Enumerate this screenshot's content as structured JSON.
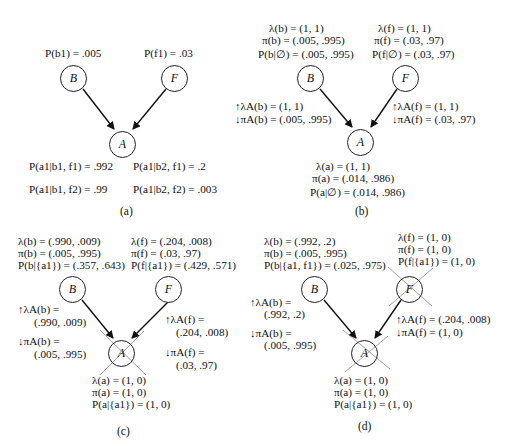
{
  "panels": {
    "a": {
      "caption": "(a)",
      "nodes": {
        "B": "B",
        "F": "F",
        "A": "A"
      },
      "priors": {
        "b": "P(b1) = .005",
        "f": "P(f1) = .03"
      },
      "cpt": [
        "P(a1|b1, f1) = .992",
        "P(a1|b2, f1) = .2",
        "P(a1|b1, f2) = .99",
        "P(a1|b2, f2) = .003"
      ]
    },
    "b": {
      "caption": "(b)",
      "nodes": {
        "B": "B",
        "F": "F",
        "A": "A"
      },
      "B_info": [
        "λ(b) = (1, 1)",
        "π(b) = (.005, .995)",
        "P(b|∅) = (.005, .995)"
      ],
      "F_info": [
        "λ(f) = (1, 1)",
        "π(f) = (.03, .97)",
        "P(f|∅) = (.03, .97)"
      ],
      "B_msgs": [
        "↑λA(b) = (1, 1)",
        "↓πA(b) = (.005, .995)"
      ],
      "F_msgs": [
        "↑λA(f) = (1, 1)",
        "↓πA(f) = (.03, .97)"
      ],
      "A_info": [
        "λ(a) = (1, 1)",
        "π(a) = (.014, .986)",
        "P(a|∅) = (.014, .986)"
      ]
    },
    "c": {
      "caption": "(c)",
      "nodes": {
        "B": "B",
        "F": "F",
        "A": "A"
      },
      "B_info": [
        "λ(b) = (.990, .009)",
        "π(b) = (.005, .995)",
        "P(b|{a1}) = (.357, .643)"
      ],
      "F_info": [
        "λ(f) = (.204, .008)",
        "π(f) = (.03, .97)",
        "P(f|{a1}) = (.429, .571)"
      ],
      "B_msgs": [
        "↑λA(b) =",
        "(.990, .009)",
        "↓πA(b) =",
        "(.005, .995)"
      ],
      "F_msgs": [
        "↑λA(f) =",
        "(.204, .008)",
        "↓πA(f) =",
        "(.03, .97)"
      ],
      "A_info": [
        "λ(a) = (1, 0)",
        "π(a) = (1, 0)",
        "P(a|{a1}) = (1, 0)"
      ],
      "instantiated": [
        "A"
      ]
    },
    "d": {
      "caption": "(d)",
      "nodes": {
        "B": "B",
        "F": "F",
        "A": "A"
      },
      "B_info": [
        "λ(b) = (.992, .2)",
        "π(b) = (.005, .995)",
        "P(b|{a1, f1}) = (.025, .975)"
      ],
      "F_info": [
        "λ(f) = (1, 0)",
        "π(f) = (1, 0)",
        "P(f|{a1}) = (1, 0)"
      ],
      "B_msgs": [
        "↑λA(b) =",
        "(.992, .2)",
        "↓πA(b) =",
        "(.005, .995)"
      ],
      "F_msgs": [
        "↑λA(f) = (.204, .008)",
        "↓πA(f) = (1, 0)"
      ],
      "A_info": [
        "λ(a) = (1, 0)",
        "π(a) = (1, 0)",
        "P(a|{a1}) = (1, 0)"
      ],
      "instantiated": [
        "A",
        "F"
      ]
    }
  }
}
